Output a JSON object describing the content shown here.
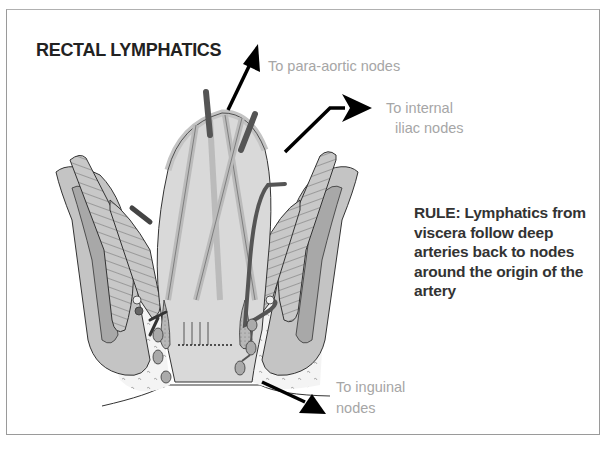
{
  "figure": {
    "title": "RECTAL LYMPHATICS",
    "labels": {
      "para_aortic": "To para-aortic nodes",
      "internal_iliac_line1": "To internal",
      "internal_iliac_line2": "iliac nodes",
      "inguinal_line1": "To inguinal",
      "inguinal_line2": "nodes"
    },
    "rule": {
      "line1": "RULE: Lymphatics from",
      "line2": "viscera follow deep",
      "line3": "arteries back to nodes",
      "line4": "around the origin of the",
      "line5": "artery"
    },
    "colors": {
      "tissue_light": "#d6d6d6",
      "tissue_mid": "#bdbdbd",
      "tissue_dark": "#a0a0a0",
      "vessel": "#555555",
      "label_gray": "#a6a6a6",
      "outline": "#333333"
    }
  }
}
